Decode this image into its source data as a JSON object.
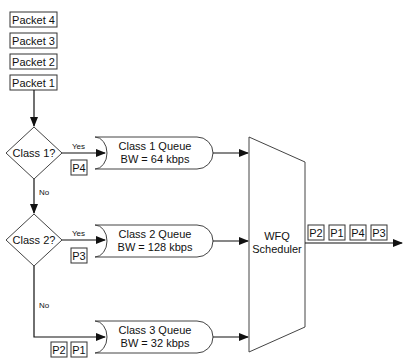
{
  "diagram": {
    "type": "flowchart",
    "incoming_packets": [
      "Packet 4",
      "Packet 3",
      "Packet 2",
      "Packet 1"
    ],
    "decisions": [
      {
        "label": "Class 1?",
        "yes_label": "Yes",
        "no_label": "No"
      },
      {
        "label": "Class 2?",
        "yes_label": "Yes",
        "no_label": "No"
      }
    ],
    "queues": [
      {
        "name": "Class 1 Queue",
        "bandwidth": "BW = 64 kbps",
        "packets": [
          "P4"
        ]
      },
      {
        "name": "Class 2 Queue",
        "bandwidth": "BW = 128 kbps",
        "packets": [
          "P3"
        ]
      },
      {
        "name": "Class 3 Queue",
        "bandwidth": "BW = 32 kbps",
        "packets": [
          "P2",
          "P1"
        ]
      }
    ],
    "scheduler": {
      "line1": "WFQ",
      "line2": "Scheduler"
    },
    "output_packets": [
      "P2",
      "P1",
      "P4",
      "P3"
    ]
  }
}
